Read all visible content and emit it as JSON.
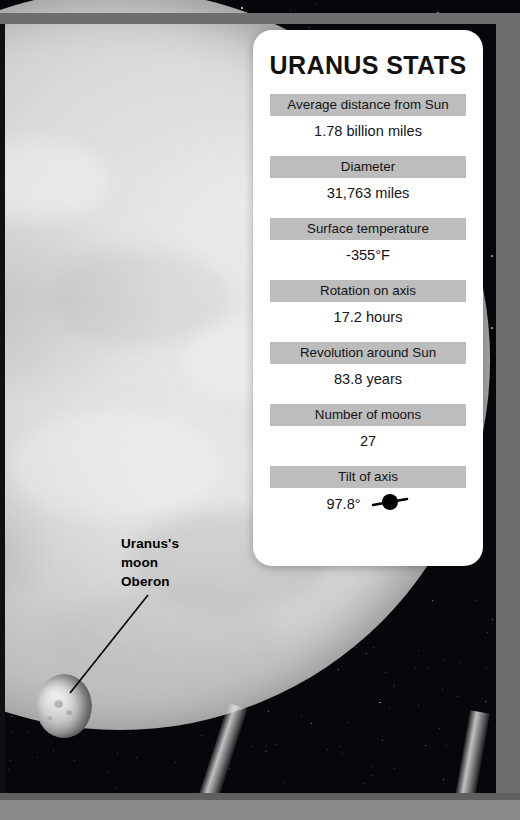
{
  "panel": {
    "title": "URANUS STATS",
    "stats": [
      {
        "label": "Average distance from Sun",
        "value": "1.78 billion miles"
      },
      {
        "label": "Diameter",
        "value": "31,763 miles"
      },
      {
        "label": "Surface temperature",
        "value": "-355°F"
      },
      {
        "label": "Rotation on axis",
        "value": "17.2 hours"
      },
      {
        "label": "Revolution around Sun",
        "value": "83.8 years"
      },
      {
        "label": "Number of moons",
        "value": "27"
      },
      {
        "label": "Tilt of axis",
        "value": "97.8°"
      }
    ],
    "tilt_icon_name": "tilted-planet-axis-icon"
  },
  "annotations": {
    "moon_label_line1": "Uranus's",
    "moon_label_line2": "moon",
    "moon_label_line3": "Oberon"
  },
  "objects": {
    "planet_name": "uranus-planet",
    "moon_name": "oberon-moon",
    "rings_name": "uranus-rings"
  },
  "colors": {
    "panel_bg": "#ffffff",
    "label_bar": "#bdbdbd",
    "text": "#141414",
    "frame": "#6e6e6e",
    "sky": "#07070b",
    "planet_light": "#e9e9e9"
  }
}
